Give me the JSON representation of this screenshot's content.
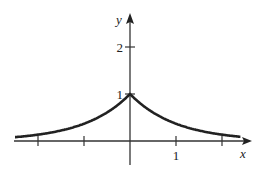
{
  "chart_data": {
    "type": "line",
    "title": "",
    "function": "y = e^(-|x|)",
    "xlabel": "x",
    "ylabel": "y",
    "xlim": [
      -2.5,
      2.5
    ],
    "ylim": [
      -0.4,
      2.6
    ],
    "x_ticks": [
      -2,
      -1,
      0,
      1,
      2
    ],
    "x_tick_labels": [
      {
        "value": 1,
        "label": "1"
      }
    ],
    "y_ticks": [
      1,
      2
    ],
    "y_tick_labels": [
      {
        "value": 1,
        "label": "1"
      },
      {
        "value": 2,
        "label": "2"
      }
    ],
    "series": [
      {
        "name": "e^(-|x|)",
        "x": [
          -2.45,
          -2,
          -1.5,
          -1,
          -0.5,
          0,
          0.5,
          1,
          1.5,
          2,
          2.4
        ],
        "y": [
          0.086,
          0.135,
          0.223,
          0.368,
          0.607,
          1,
          0.607,
          0.368,
          0.223,
          0.135,
          0.091
        ]
      }
    ],
    "grid": false,
    "legend": "none",
    "color": "#222222"
  }
}
